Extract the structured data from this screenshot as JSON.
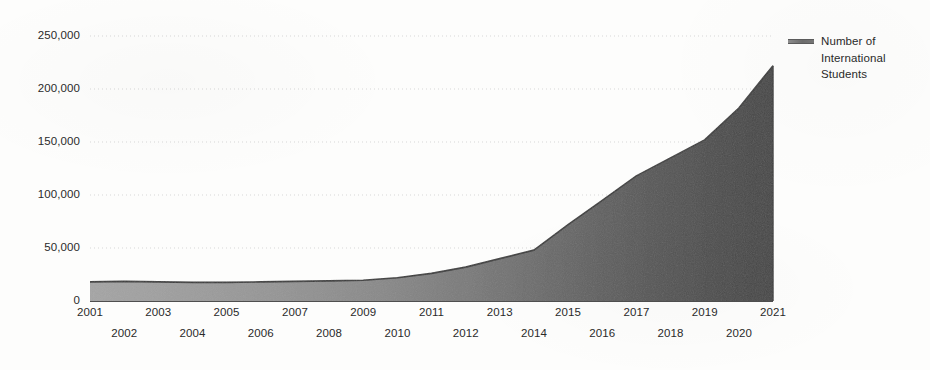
{
  "chart_data": {
    "type": "area",
    "title": "",
    "subtitle": "",
    "xlabel": "",
    "ylabel": "",
    "xlim": [
      2001,
      2021
    ],
    "ylim": [
      0,
      250000
    ],
    "grid": true,
    "grid_style": "dotted-horizontal",
    "legend_position": "right",
    "series_name": "Number of International Students",
    "x": [
      2001,
      2002,
      2003,
      2004,
      2005,
      2006,
      2007,
      2008,
      2009,
      2010,
      2011,
      2012,
      2013,
      2014,
      2015,
      2016,
      2017,
      2018,
      2019,
      2020,
      2021
    ],
    "values": [
      18000,
      18500,
      18000,
      17500,
      17500,
      18000,
      18500,
      19000,
      19500,
      22000,
      26000,
      32000,
      40000,
      48000,
      72000,
      95000,
      118000,
      135000,
      152000,
      182000,
      222000
    ],
    "categories": [
      "2001",
      "2002",
      "2003",
      "2004",
      "2005",
      "2006",
      "2007",
      "2008",
      "2009",
      "2010",
      "2011",
      "2012",
      "2013",
      "2014",
      "2015",
      "2016",
      "2017",
      "2018",
      "2019",
      "2020",
      "2021"
    ],
    "series": [
      {
        "name": "Number of International Students",
        "values": [
          18000,
          18500,
          18000,
          17500,
          17500,
          18000,
          18500,
          19000,
          19500,
          22000,
          26000,
          32000,
          40000,
          48000,
          72000,
          95000,
          118000,
          135000,
          152000,
          182000,
          222000
        ]
      }
    ],
    "annotations": []
  },
  "axes": {
    "y_ticks": [
      "250,000",
      "200,000",
      "150,000",
      "100,000",
      "50,000",
      "0"
    ],
    "y_tick_values": [
      250000,
      200000,
      150000,
      100000,
      50000,
      0
    ],
    "x_ticks_top_row": [
      "2001",
      "2003",
      "2005",
      "2007",
      "2009",
      "2011",
      "2013",
      "2015",
      "2017",
      "2019",
      "2021"
    ],
    "x_ticks_bottom_row": [
      "2002",
      "2004",
      "2006",
      "2008",
      "2010",
      "2012",
      "2014",
      "2016",
      "2018",
      "2020"
    ]
  },
  "legend": {
    "entries": [
      {
        "swatch_icon": "line-swatch-icon",
        "line1": "Number of",
        "line2": "International",
        "line3": "Students"
      }
    ]
  },
  "colors": {
    "area_fill_left": "#9d9d9d",
    "area_fill_right": "#4a4a4a",
    "area_stroke": "#3a3a3a",
    "gridline": "#d9d9d9",
    "axis_line": "#555555",
    "text": "#2a2a2a",
    "background": "#fdfdfc"
  }
}
